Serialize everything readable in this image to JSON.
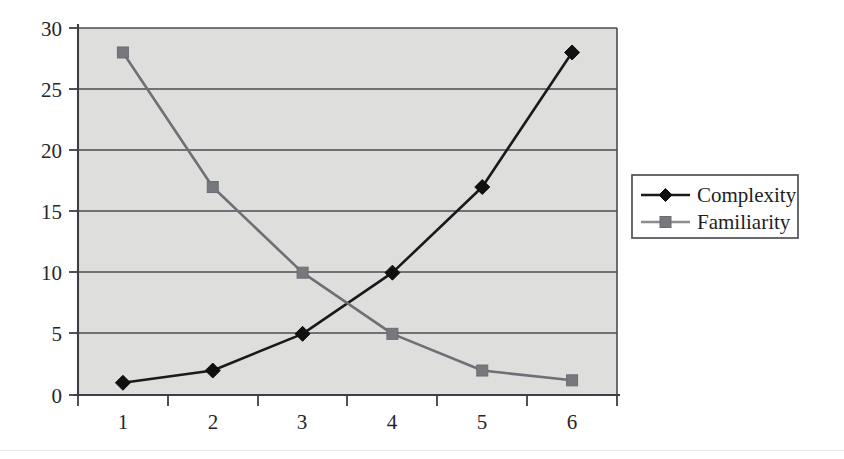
{
  "chart_data": {
    "type": "line",
    "title": "",
    "subtitle": "",
    "xlabel": "",
    "ylabel": "",
    "categories": [
      "1",
      "2",
      "3",
      "4",
      "5",
      "6"
    ],
    "x": [
      1,
      2,
      3,
      4,
      5,
      6
    ],
    "series": [
      {
        "name": "Complexity",
        "values": [
          1,
          2,
          5,
          10,
          17,
          28
        ],
        "color": "#1a1a1a",
        "marker": "diamond"
      },
      {
        "name": "Familiarity",
        "values": [
          28,
          17,
          10,
          5,
          2,
          1.2
        ],
        "color": "#6e7075",
        "marker": "square"
      }
    ],
    "ylim": [
      0,
      30
    ],
    "yticks": [
      0,
      5,
      10,
      15,
      20,
      25,
      30
    ],
    "ytick_labels": [
      "0",
      "5",
      "10",
      "15",
      "20",
      "25",
      "30"
    ],
    "xtick_labels": [
      "1",
      "2",
      "3",
      "4",
      "5",
      "6"
    ],
    "grid": "horizontal",
    "legend_position": "right",
    "plot_background": "#dededd",
    "figure_background": "#ffffff"
  },
  "legend": {
    "entries": [
      {
        "label": "Complexity",
        "marker": "diamond-marker-icon"
      },
      {
        "label": "Familiarity",
        "marker": "square-marker-icon"
      }
    ]
  },
  "axes": {
    "y_tick_0": "0",
    "y_tick_5": "5",
    "y_tick_10": "10",
    "y_tick_15": "15",
    "y_tick_20": "20",
    "y_tick_25": "25",
    "y_tick_30": "30",
    "x_tick_1": "1",
    "x_tick_2": "2",
    "x_tick_3": "3",
    "x_tick_4": "4",
    "x_tick_5": "5",
    "x_tick_6": "6"
  }
}
